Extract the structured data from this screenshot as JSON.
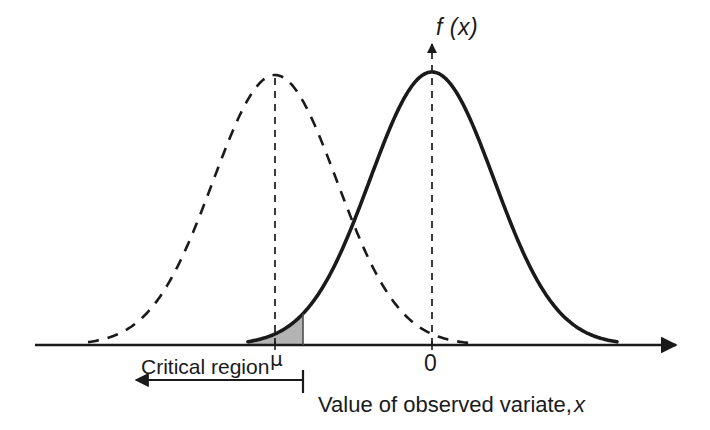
{
  "figure": {
    "title_label": "f (x)",
    "axis_vertical_label": "f (x)",
    "mu_label": "μ",
    "zero_label": "0",
    "critical_region_label": "Critical region",
    "caption_prefix": "Value of observed variate,",
    "caption_variable": "x"
  },
  "colors": {
    "curve": "#1a1a1a",
    "axis": "#1a1a1a",
    "shade_fill": "#b3b3b3",
    "text": "#1a1a1a",
    "background": "#ffffff"
  },
  "chart_data": {
    "type": "line",
    "title": "",
    "xlabel": "Value of observed variate, x",
    "ylabel": "f (x)",
    "grid": false,
    "legend": "none",
    "xlim": [
      35,
      680
    ],
    "ylim": [
      0,
      280
    ],
    "annotations": [
      {
        "name": "mu",
        "text": "μ",
        "x": 278,
        "y": 359
      },
      {
        "name": "zero",
        "text": "0",
        "x": 430,
        "y": 362
      },
      {
        "name": "critical-region",
        "text": "Critical region",
        "x": 213,
        "y": 367
      },
      {
        "name": "f-of-x",
        "text": "f (x)",
        "x": 450,
        "y": 28
      },
      {
        "name": "caption",
        "text": "Value of observed variate, x",
        "x": 440,
        "y": 405
      }
    ],
    "series": [
      {
        "name": "null-distribution",
        "style": "dashed",
        "mean_px": 275,
        "sigma_px": 62,
        "peak_px": 75,
        "baseline_px": 345,
        "tail_left_px": 88,
        "tail_right_px": 470
      },
      {
        "name": "alternative-distribution",
        "style": "solid",
        "mean_px": 432,
        "sigma_px": 62,
        "peak_px": 72,
        "baseline_px": 345,
        "tail_left_px": 248,
        "tail_right_px": 618
      }
    ],
    "shaded_regions": [
      {
        "name": "critical-region-shade",
        "under_series": "alternative-distribution",
        "x_from_px": 248,
        "x_to_px": 303,
        "fill": "#b3b3b3"
      }
    ],
    "reference_lines": [
      {
        "name": "mu-line",
        "x_px": 275,
        "style": "dashed",
        "from_px": 345,
        "to_px": 75
      },
      {
        "name": "zero-line",
        "x_px": 432,
        "style": "dashed",
        "from_px": 345,
        "to_px": 42,
        "arrow": "up"
      }
    ],
    "axis_ticks": [
      {
        "name": "mu-tick",
        "x_px": 275,
        "label": "μ"
      },
      {
        "name": "zero-tick",
        "x_px": 432,
        "label": "0"
      }
    ],
    "critical_region_arrow": {
      "name": "critical-region-arrow",
      "y_px": 380,
      "x_from_px": 303,
      "x_to_px": 133,
      "direction": "left"
    }
  }
}
